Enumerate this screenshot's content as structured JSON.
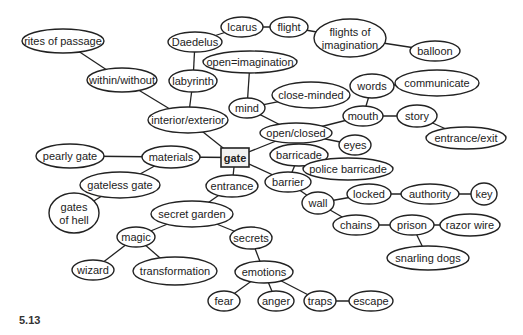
{
  "figure": {
    "caption": "5.13",
    "center": {
      "id": "gate",
      "label": "gate",
      "x": 221,
      "y": 148,
      "w": 28,
      "h": 19
    },
    "style": {
      "stroke": "#222222",
      "fill": "#ffffff",
      "text": "#222222",
      "box_fill": "#f2f2f2"
    },
    "nodes": [
      {
        "id": "icarus",
        "label": "Icarus",
        "cx": 242,
        "cy": 27,
        "rx": 21,
        "ry": 10
      },
      {
        "id": "flight",
        "label": "flight",
        "cx": 289,
        "cy": 27,
        "rx": 19,
        "ry": 10
      },
      {
        "id": "flights-of-imagination",
        "label": "flights of|imagination",
        "cx": 350,
        "cy": 38,
        "rx": 36,
        "ry": 19
      },
      {
        "id": "balloon",
        "label": "balloon",
        "cx": 435,
        "cy": 51,
        "rx": 25,
        "ry": 10
      },
      {
        "id": "daedelus",
        "label": "Daedelus",
        "cx": 195,
        "cy": 42,
        "rx": 27,
        "ry": 10
      },
      {
        "id": "open-imagination",
        "label": "open=imagination",
        "cx": 250,
        "cy": 62,
        "rx": 47,
        "ry": 11
      },
      {
        "id": "rites-of-passage",
        "label": "rites of passage",
        "cx": 63,
        "cy": 41,
        "rx": 41,
        "ry": 12
      },
      {
        "id": "within-without",
        "label": "within/without",
        "cx": 122,
        "cy": 80,
        "rx": 35,
        "ry": 12
      },
      {
        "id": "labyrinth",
        "label": "labyrinth",
        "cx": 193,
        "cy": 81,
        "rx": 24,
        "ry": 11
      },
      {
        "id": "mind",
        "label": "mind",
        "cx": 247,
        "cy": 108,
        "rx": 18,
        "ry": 10
      },
      {
        "id": "close-minded",
        "label": "close-minded",
        "cx": 311,
        "cy": 95,
        "rx": 39,
        "ry": 13
      },
      {
        "id": "words",
        "label": "words",
        "cx": 372,
        "cy": 86,
        "rx": 22,
        "ry": 12
      },
      {
        "id": "communicate",
        "label": "communicate",
        "cx": 437,
        "cy": 83,
        "rx": 42,
        "ry": 13
      },
      {
        "id": "mouth",
        "label": "mouth",
        "cx": 363,
        "cy": 116,
        "rx": 20,
        "ry": 10
      },
      {
        "id": "story",
        "label": "story",
        "cx": 417,
        "cy": 116,
        "rx": 20,
        "ry": 11
      },
      {
        "id": "entrance-exit",
        "label": "entrance/exit",
        "cx": 466,
        "cy": 138,
        "rx": 40,
        "ry": 11
      },
      {
        "id": "interior-exterior",
        "label": "interior/exterior",
        "cx": 188,
        "cy": 120,
        "rx": 40,
        "ry": 13
      },
      {
        "id": "open-closed",
        "label": "open/closed",
        "cx": 296,
        "cy": 133,
        "rx": 36,
        "ry": 10
      },
      {
        "id": "eyes",
        "label": "eyes",
        "cx": 355,
        "cy": 145,
        "rx": 16,
        "ry": 10
      },
      {
        "id": "materials",
        "label": "materials",
        "cx": 171,
        "cy": 157,
        "rx": 29,
        "ry": 11
      },
      {
        "id": "pearly-gate",
        "label": "pearly gate",
        "cx": 70,
        "cy": 156,
        "rx": 34,
        "ry": 12
      },
      {
        "id": "barricade",
        "label": "barricade",
        "cx": 299,
        "cy": 155,
        "rx": 29,
        "ry": 11
      },
      {
        "id": "police-barricade",
        "label": "police barricade",
        "cx": 348,
        "cy": 169,
        "rx": 45,
        "ry": 11
      },
      {
        "id": "gateless-gate",
        "label": "gateless gate",
        "cx": 120,
        "cy": 185,
        "rx": 40,
        "ry": 13
      },
      {
        "id": "entrance",
        "label": "entrance",
        "cx": 232,
        "cy": 186,
        "rx": 26,
        "ry": 11
      },
      {
        "id": "barrier",
        "label": "barrier",
        "cx": 288,
        "cy": 182,
        "rx": 23,
        "ry": 10
      },
      {
        "id": "wall",
        "label": "wall",
        "cx": 318,
        "cy": 203,
        "rx": 16,
        "ry": 11
      },
      {
        "id": "locked",
        "label": "locked",
        "cx": 369,
        "cy": 194,
        "rx": 22,
        "ry": 10
      },
      {
        "id": "authority",
        "label": "authority",
        "cx": 430,
        "cy": 194,
        "rx": 29,
        "ry": 10
      },
      {
        "id": "key",
        "label": "key",
        "cx": 484,
        "cy": 194,
        "rx": 13,
        "ry": 11
      },
      {
        "id": "gates-of-hell",
        "label": "gates|of hell",
        "cx": 74,
        "cy": 213,
        "rx": 25,
        "ry": 20
      },
      {
        "id": "secret-garden",
        "label": "secret garden",
        "cx": 192,
        "cy": 214,
        "rx": 41,
        "ry": 13
      },
      {
        "id": "chains",
        "label": "chains",
        "cx": 356,
        "cy": 225,
        "rx": 23,
        "ry": 10
      },
      {
        "id": "prison",
        "label": "prison",
        "cx": 412,
        "cy": 225,
        "rx": 22,
        "ry": 10
      },
      {
        "id": "razor-wire",
        "label": "razor wire",
        "cx": 470,
        "cy": 225,
        "rx": 30,
        "ry": 11
      },
      {
        "id": "magic",
        "label": "magic",
        "cx": 136,
        "cy": 237,
        "rx": 19,
        "ry": 10
      },
      {
        "id": "secrets",
        "label": "secrets",
        "cx": 251,
        "cy": 238,
        "rx": 21,
        "ry": 11
      },
      {
        "id": "snarling-dogs",
        "label": "snarling dogs",
        "cx": 428,
        "cy": 258,
        "rx": 41,
        "ry": 12
      },
      {
        "id": "wizard",
        "label": "wizard",
        "cx": 93,
        "cy": 270,
        "rx": 21,
        "ry": 10
      },
      {
        "id": "transformation",
        "label": "transformation",
        "cx": 175,
        "cy": 271,
        "rx": 42,
        "ry": 14
      },
      {
        "id": "emotions",
        "label": "emotions",
        "cx": 264,
        "cy": 272,
        "rx": 29,
        "ry": 11
      },
      {
        "id": "fear",
        "label": "fear",
        "cx": 224,
        "cy": 301,
        "rx": 16,
        "ry": 10
      },
      {
        "id": "anger",
        "label": "anger",
        "cx": 276,
        "cy": 301,
        "rx": 18,
        "ry": 10
      },
      {
        "id": "traps",
        "label": "traps",
        "cx": 320,
        "cy": 301,
        "rx": 16,
        "ry": 10
      },
      {
        "id": "escape",
        "label": "escape",
        "cx": 371,
        "cy": 301,
        "rx": 22,
        "ry": 10
      }
    ],
    "edges": [
      [
        "gate",
        "interior-exterior"
      ],
      [
        "gate",
        "open-closed"
      ],
      [
        "gate",
        "materials"
      ],
      [
        "gate",
        "entrance"
      ],
      [
        "gate",
        "barrier"
      ],
      [
        "interior-exterior",
        "within-without"
      ],
      [
        "interior-exterior",
        "labyrinth"
      ],
      [
        "within-without",
        "rites-of-passage"
      ],
      [
        "labyrinth",
        "daedelus"
      ],
      [
        "daedelus",
        "icarus"
      ],
      [
        "icarus",
        "flight"
      ],
      [
        "flight",
        "flights-of-imagination"
      ],
      [
        "flights-of-imagination",
        "balloon"
      ],
      [
        "open-closed",
        "mind"
      ],
      [
        "mind",
        "open-imagination"
      ],
      [
        "mind",
        "close-minded"
      ],
      [
        "open-closed",
        "mouth"
      ],
      [
        "open-closed",
        "eyes"
      ],
      [
        "mouth",
        "words"
      ],
      [
        "words",
        "communicate"
      ],
      [
        "mouth",
        "story"
      ],
      [
        "story",
        "entrance-exit"
      ],
      [
        "materials",
        "pearly-gate"
      ],
      [
        "materials",
        "gateless-gate"
      ],
      [
        "gateless-gate",
        "gates-of-hell"
      ],
      [
        "barrier",
        "barricade"
      ],
      [
        "barricade",
        "police-barricade"
      ],
      [
        "barrier",
        "wall"
      ],
      [
        "wall",
        "locked"
      ],
      [
        "locked",
        "authority"
      ],
      [
        "authority",
        "key"
      ],
      [
        "wall",
        "chains"
      ],
      [
        "chains",
        "prison"
      ],
      [
        "prison",
        "razor-wire"
      ],
      [
        "prison",
        "snarling-dogs"
      ],
      [
        "entrance",
        "secret-garden"
      ],
      [
        "secret-garden",
        "magic"
      ],
      [
        "secret-garden",
        "secrets"
      ],
      [
        "magic",
        "wizard"
      ],
      [
        "magic",
        "transformation"
      ],
      [
        "secrets",
        "emotions"
      ],
      [
        "emotions",
        "fear"
      ],
      [
        "emotions",
        "anger"
      ],
      [
        "emotions",
        "traps"
      ],
      [
        "traps",
        "escape"
      ]
    ]
  }
}
